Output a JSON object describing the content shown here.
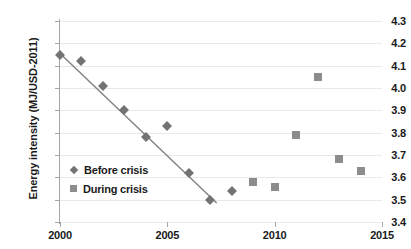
{
  "chart_data": {
    "type": "scatter",
    "title": "",
    "xlabel": "",
    "ylabel": "Energy intensity (MJ/USD-2011)",
    "xlim": [
      2000,
      2015
    ],
    "ylim": [
      3.4,
      4.3
    ],
    "xticks": [
      "2000",
      "2005",
      "2010",
      "2015"
    ],
    "yticks": [
      "4.3",
      "4.2",
      "4.1",
      "4.0",
      "3.9",
      "3.8",
      "3.7",
      "3.6",
      "3.5",
      "3.4"
    ],
    "grid": "horizontal",
    "legend_position": "inside-lower-left",
    "marker_color": "#737373",
    "square_color": "#8c8c8c",
    "trendline_color": "#808080",
    "series": [
      {
        "name": "Before crisis",
        "marker": "diamond",
        "x": [
          2000,
          2001,
          2002,
          2003,
          2004,
          2005,
          2006,
          2007,
          2008
        ],
        "values": [
          4.15,
          4.12,
          4.01,
          3.9,
          3.78,
          3.83,
          3.62,
          3.5,
          3.54
        ]
      },
      {
        "name": "During crisis",
        "marker": "square",
        "x": [
          2009,
          2010,
          2011,
          2012,
          2013,
          2014
        ],
        "values": [
          3.58,
          3.555,
          3.79,
          4.05,
          3.68,
          3.63
        ]
      }
    ],
    "trendline": {
      "name": "Before crisis linear fit",
      "x": [
        2000.1,
        2007.3
      ],
      "y": [
        4.145,
        3.485
      ]
    }
  },
  "legend": {
    "items": [
      {
        "label": "Before crisis"
      },
      {
        "label": "During crisis"
      }
    ]
  }
}
